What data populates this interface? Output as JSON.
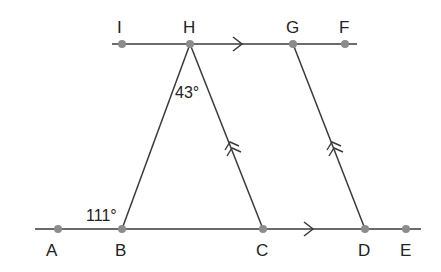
{
  "diagram": {
    "colors": {
      "line": "#3a3a3a",
      "point": "#8c8c8c",
      "text": "#222222"
    },
    "points": {
      "I": {
        "label": "I",
        "x": 122,
        "y": 44
      },
      "H": {
        "label": "H",
        "x": 190,
        "y": 44
      },
      "G": {
        "label": "G",
        "x": 293,
        "y": 44
      },
      "F": {
        "label": "F",
        "x": 345,
        "y": 44
      },
      "A": {
        "label": "A",
        "x": 58,
        "y": 229
      },
      "B": {
        "label": "B",
        "x": 122,
        "y": 229
      },
      "C": {
        "label": "C",
        "x": 263,
        "y": 229
      },
      "D": {
        "label": "D",
        "x": 365,
        "y": 229
      },
      "E": {
        "label": "E",
        "x": 406,
        "y": 229
      }
    },
    "angles": {
      "H": "43°",
      "B": "111°"
    }
  }
}
